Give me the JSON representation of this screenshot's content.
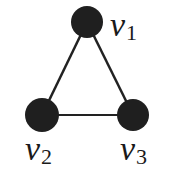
{
  "diagram": {
    "type": "graph",
    "nodes": [
      {
        "id": "v1",
        "label": "v",
        "subscript": "1",
        "x": 87,
        "y": 22
      },
      {
        "id": "v2",
        "label": "v",
        "subscript": "2",
        "x": 42,
        "y": 115
      },
      {
        "id": "v3",
        "label": "v",
        "subscript": "3",
        "x": 133,
        "y": 115
      }
    ],
    "edges": [
      {
        "from": "v1",
        "to": "v2"
      },
      {
        "from": "v1",
        "to": "v3"
      },
      {
        "from": "v2",
        "to": "v3"
      }
    ],
    "colors": {
      "node": "#1f1f1f",
      "edge": "#222222",
      "background": "#ffffff"
    }
  }
}
